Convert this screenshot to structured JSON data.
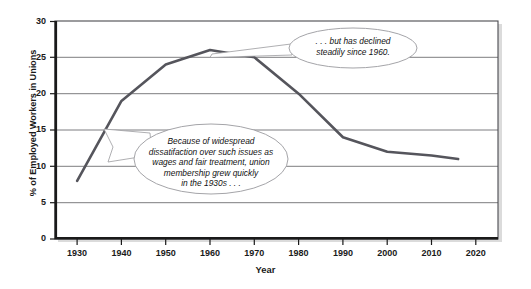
{
  "chart_data": {
    "type": "line",
    "title": "",
    "xlabel": "Year",
    "ylabel": "% of Employed Workers in Unions",
    "xlim": [
      1925,
      2025
    ],
    "ylim": [
      0,
      30
    ],
    "grid": true,
    "legend": "none",
    "x": [
      1930,
      1940,
      1950,
      1960,
      1970,
      1980,
      1990,
      2000,
      2010,
      2016
    ],
    "values": [
      8,
      19,
      24,
      26,
      25,
      20,
      14,
      12,
      11.5,
      11
    ],
    "series": [
      {
        "name": "% of Employed Workers in Unions",
        "color": "#55555c",
        "values": [
          8,
          19,
          24,
          26,
          25,
          20,
          14,
          12,
          11.5,
          11
        ]
      }
    ],
    "xticks": [
      "1930",
      "1940",
      "1950",
      "1960",
      "1970",
      "1980",
      "1990",
      "2000",
      "2010",
      "2020"
    ],
    "xtick_values": [
      1930,
      1940,
      1950,
      1960,
      1970,
      1980,
      1990,
      2000,
      2010,
      2020
    ],
    "yticks": [
      "0",
      "5",
      "10",
      "15",
      "20",
      "25",
      "30"
    ],
    "ytick_values": [
      0,
      5,
      10,
      15,
      20,
      25,
      30
    ],
    "annotations": [
      {
        "name": "union-growth-callout",
        "text": "Because of widespread dissatifaction over such issues as wages and fair treatment, union membership grew quickly in the 1930s . . .",
        "lines": [
          "Because of widespread",
          "dissatifaction over such issues as",
          "wages and fair treatment, union",
          "membership grew quickly",
          "in the 1930s . . ."
        ],
        "points_to_year": 1936
      },
      {
        "name": "union-decline-callout",
        "text": ". . . but has declined steadily since 1960.",
        "lines": [
          ". . . but has declined",
          "steadily since 1960."
        ],
        "points_to_year": 1960
      }
    ]
  },
  "colors": {
    "line": "#55555c",
    "grid": "#6e6e72",
    "axis": "#1a1a1a",
    "callout_stroke": "#8c8c90",
    "callout_fill": "#ffffff",
    "background": "#ffffff"
  }
}
